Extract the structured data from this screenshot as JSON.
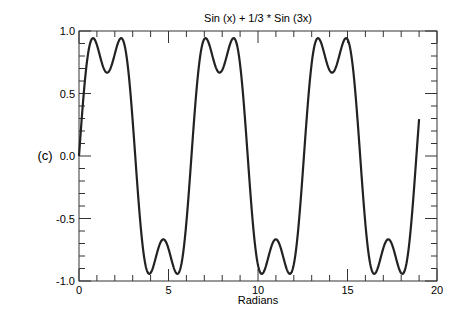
{
  "chart_data": {
    "type": "line",
    "title": "Sin (x) + 1/3 * Sin (3x)",
    "panel_label": "(c)",
    "xlabel": "Radians",
    "ylabel": "",
    "xlim": [
      0,
      20
    ],
    "ylim": [
      -1.0,
      1.0
    ],
    "x_ticks": [
      0,
      5,
      10,
      15,
      20
    ],
    "x_tick_labels": [
      "0",
      "5",
      "10",
      "15",
      "20"
    ],
    "x_minor_step": 1,
    "y_ticks": [
      -1.0,
      -0.5,
      0.0,
      0.5,
      1.0
    ],
    "y_tick_labels": [
      "-1.0",
      "-0.5",
      "0.0",
      "0.5",
      "1.0"
    ],
    "y_minor_step": 0.1,
    "grid": false,
    "legend": null,
    "series": [
      {
        "name": "Sin (x) + 1/3 * Sin (3x)",
        "function": "sin(x) + sin(3x)/3",
        "x_range": [
          0,
          19
        ],
        "color": "#222222",
        "key_points": [
          {
            "x": 0,
            "y": 0.0
          },
          {
            "x": 0.79,
            "y": 0.94
          },
          {
            "x": 1.57,
            "y": 0.67
          },
          {
            "x": 2.36,
            "y": 0.94
          },
          {
            "x": 3.14,
            "y": 0.0
          },
          {
            "x": 3.93,
            "y": -0.94
          },
          {
            "x": 4.71,
            "y": -0.67
          },
          {
            "x": 5.5,
            "y": -0.94
          },
          {
            "x": 6.28,
            "y": 0.0
          },
          {
            "x": 7.07,
            "y": 0.94
          },
          {
            "x": 7.85,
            "y": 0.67
          },
          {
            "x": 8.64,
            "y": 0.94
          },
          {
            "x": 9.42,
            "y": 0.0
          },
          {
            "x": 10.21,
            "y": -0.94
          },
          {
            "x": 11.0,
            "y": -0.67
          },
          {
            "x": 11.78,
            "y": -0.94
          },
          {
            "x": 12.57,
            "y": 0.0
          },
          {
            "x": 13.35,
            "y": 0.94
          },
          {
            "x": 14.14,
            "y": 0.67
          },
          {
            "x": 14.92,
            "y": 0.94
          },
          {
            "x": 15.71,
            "y": 0.0
          },
          {
            "x": 16.49,
            "y": -0.94
          },
          {
            "x": 17.28,
            "y": -0.67
          },
          {
            "x": 18.06,
            "y": -0.94
          },
          {
            "x": 19.0,
            "y": 0.12
          }
        ]
      }
    ]
  }
}
